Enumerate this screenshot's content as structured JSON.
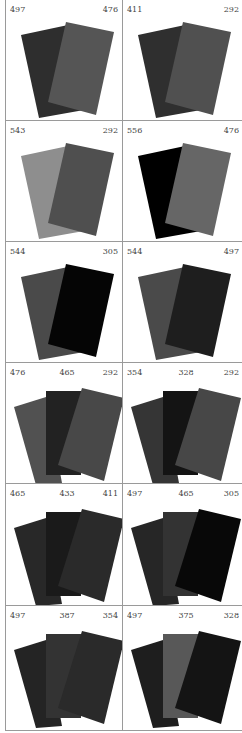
{
  "cells": [
    {
      "labels": [
        "497",
        "476"
      ],
      "cards": [
        {
          "fill": "#2e2e2e"
        },
        {
          "fill": "#555555"
        }
      ]
    },
    {
      "labels": [
        "411",
        "292"
      ],
      "cards": [
        {
          "fill": "#2f2f2f"
        },
        {
          "fill": "#505050"
        }
      ]
    },
    {
      "labels": [
        "543",
        "292"
      ],
      "cards": [
        {
          "fill": "#8e8e8e"
        },
        {
          "fill": "#4f4f4f"
        }
      ]
    },
    {
      "labels": [
        "556",
        "476"
      ],
      "cards": [
        {
          "fill": "#000000"
        },
        {
          "fill": "#666666"
        }
      ]
    },
    {
      "labels": [
        "544",
        "305"
      ],
      "cards": [
        {
          "fill": "#4a4a4a"
        },
        {
          "fill": "#050505"
        }
      ]
    },
    {
      "labels": [
        "544",
        "497"
      ],
      "cards": [
        {
          "fill": "#4a4a4a"
        },
        {
          "fill": "#1e1e1e"
        }
      ]
    },
    {
      "labels": [
        "476",
        "465",
        "292"
      ],
      "cards": [
        {
          "fill": "#515151"
        },
        {
          "fill": "#222222"
        },
        {
          "fill": "#484848"
        }
      ]
    },
    {
      "labels": [
        "354",
        "328",
        "292"
      ],
      "cards": [
        {
          "fill": "#353535"
        },
        {
          "fill": "#141414"
        },
        {
          "fill": "#474747"
        }
      ]
    },
    {
      "labels": [
        "465",
        "433",
        "411"
      ],
      "cards": [
        {
          "fill": "#282828"
        },
        {
          "fill": "#1a1a1a"
        },
        {
          "fill": "#2a2a2a"
        }
      ]
    },
    {
      "labels": [
        "497",
        "465",
        "305"
      ],
      "cards": [
        {
          "fill": "#262626"
        },
        {
          "fill": "#333333"
        },
        {
          "fill": "#080808"
        }
      ]
    },
    {
      "labels": [
        "497",
        "387",
        "354"
      ],
      "cards": [
        {
          "fill": "#242424"
        },
        {
          "fill": "#333333"
        },
        {
          "fill": "#2a2a2a"
        }
      ]
    },
    {
      "labels": [
        "497",
        "375",
        "328"
      ],
      "cards": [
        {
          "fill": "#1e1e1e"
        },
        {
          "fill": "#585858"
        },
        {
          "fill": "#141414"
        }
      ]
    }
  ]
}
